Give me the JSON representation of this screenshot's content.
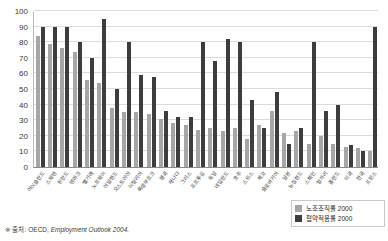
{
  "chart_data": {
    "type": "bar",
    "title": "",
    "xlabel": "",
    "ylabel": "",
    "ylim": [
      0,
      100
    ],
    "yticks": [
      0,
      10,
      20,
      30,
      40,
      50,
      60,
      70,
      80,
      90,
      100
    ],
    "grid": true,
    "legend_position": "bottom-right",
    "categories": [
      "아이슬란드",
      "스웨덴",
      "핀란드",
      "덴마크",
      "벨기에",
      "노르웨이",
      "아일랜드",
      "오스트리아",
      "이탈리아",
      "룩셈부르크",
      "영국",
      "캐나다",
      "그리스",
      "포르투갈",
      "독일",
      "네덜란드",
      "호주",
      "스위스",
      "체코",
      "슬로바키아",
      "일본",
      "뉴질랜드",
      "스페인",
      "헝가리",
      "폴란드",
      "미국",
      "한국",
      "프랑스"
    ],
    "series": [
      {
        "name": "노조조직률 2000",
        "color": "#a6a6a6",
        "values": [
          84,
          79,
          76,
          74,
          56,
          54,
          38,
          35,
          35,
          34,
          31,
          28,
          27,
          24,
          25,
          23,
          25,
          18,
          27,
          36,
          22,
          23,
          15,
          20,
          15,
          13,
          12,
          10
        ]
      },
      {
        "name": "협약적용률 2000",
        "color": "#3d3d3d",
        "values": [
          90,
          90,
          90,
          80,
          70,
          95,
          50,
          80,
          59,
          58,
          36,
          32,
          32,
          80,
          68,
          82,
          80,
          43,
          25,
          48,
          15,
          25,
          80,
          36,
          40,
          14,
          10,
          90
        ]
      }
    ],
    "legend": [
      {
        "label": "노조조직률 2000",
        "color": "#a6a6a6"
      },
      {
        "label": "협약적용률 2000",
        "color": "#3d3d3d"
      }
    ]
  },
  "source": {
    "star": "※",
    "label": "출처:",
    "org": "OECD,",
    "publication": "Employment Outlook 2004."
  }
}
